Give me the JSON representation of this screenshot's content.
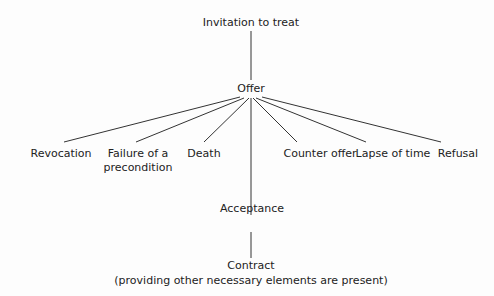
{
  "nodes": {
    "invitation": "Invitation to treat",
    "offer": "Offer",
    "terminators": [
      {
        "label": "Revocation",
        "line2": ""
      },
      {
        "label": "Failure of a",
        "line2": "precondition"
      },
      {
        "label": "Death",
        "line2": ""
      },
      {
        "label": "Counter offer",
        "line2": ""
      },
      {
        "label": "Lapse of time",
        "line2": ""
      },
      {
        "label": "Refusal",
        "line2": ""
      }
    ],
    "acceptance": "Acceptance",
    "contract": "Contract",
    "contract_note": "(providing other necessary elements are present)"
  }
}
